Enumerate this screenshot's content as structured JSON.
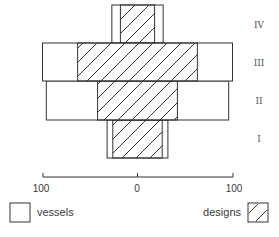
{
  "chart_data": {
    "type": "bar",
    "subtype": "symmetric battleship (mirrored horizontal bars)",
    "title": "",
    "categories": [
      "I",
      "II",
      "III",
      "IV"
    ],
    "series": [
      {
        "name": "vessels",
        "fill": "none",
        "values": [
          32,
          96,
          100,
          27
        ]
      },
      {
        "name": "designs",
        "fill": "hatched",
        "values": [
          26,
          42,
          63,
          18
        ]
      }
    ],
    "value_meaning": "half-width of bar on each side of center (percent)",
    "xaxis": {
      "ticks": [
        "100",
        "0",
        "100"
      ],
      "range": [
        -100,
        100
      ]
    },
    "ylabel": "",
    "legend": [
      {
        "label": "vessels",
        "swatch": "open"
      },
      {
        "label": "designs",
        "swatch": "hatched"
      }
    ],
    "legend_position": "bottom",
    "grid": false
  },
  "axis": {
    "left_label": "100",
    "center_label": "0",
    "right_label": "100"
  },
  "levels": [
    "IV",
    "III",
    "II",
    "I"
  ],
  "legend": {
    "vessels": "vessels",
    "designs": "designs"
  },
  "colors": {
    "line": "#333333",
    "background": "#ffffff"
  }
}
